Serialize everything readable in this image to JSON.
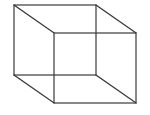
{
  "diagram": {
    "type": "necker-cube-wireframe",
    "stroke_color": "#3a3a3a",
    "background": "#ffffff",
    "back_face": {
      "x1": 14,
      "y1": 5,
      "x2": 96,
      "y2": 75
    },
    "front_face": {
      "x1": 54,
      "y1": 33,
      "x2": 136,
      "y2": 103
    }
  }
}
